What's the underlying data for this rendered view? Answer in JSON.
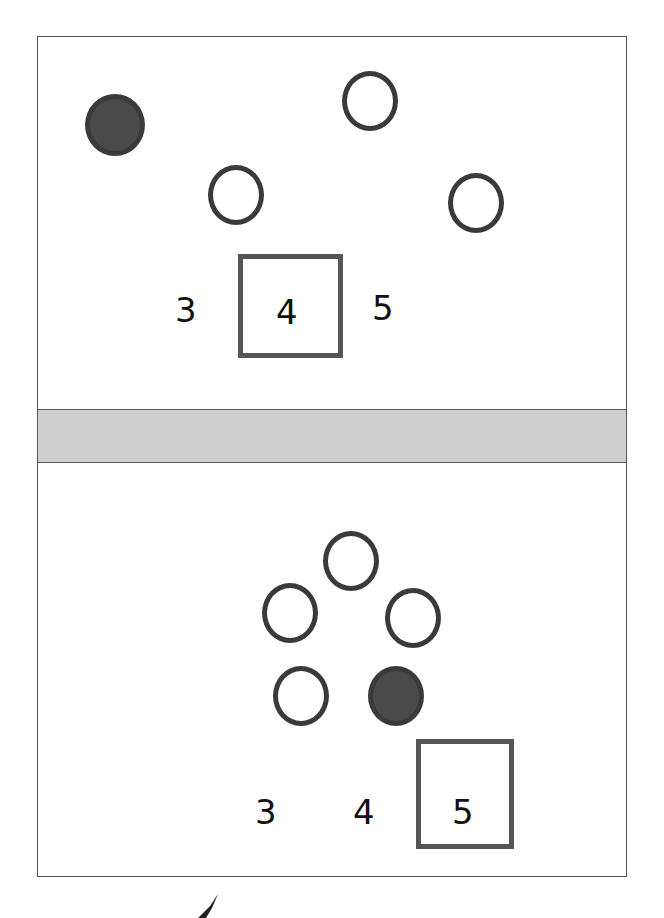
{
  "worksheet": {
    "problems": [
      {
        "id": 1,
        "circles": [
          {
            "filled": true
          },
          {
            "filled": false
          },
          {
            "filled": false
          },
          {
            "filled": false
          }
        ],
        "choices": [
          "3",
          "4",
          "5"
        ],
        "selected": "4"
      },
      {
        "id": 2,
        "circles": [
          {
            "filled": false
          },
          {
            "filled": false
          },
          {
            "filled": false
          },
          {
            "filled": false
          },
          {
            "filled": true
          }
        ],
        "choices": [
          "3",
          "4",
          "5"
        ],
        "selected": "5"
      }
    ]
  },
  "colors": {
    "outline": "#3a3a3a",
    "fill": "#4a4a4a",
    "band": "#cfcfcf"
  }
}
